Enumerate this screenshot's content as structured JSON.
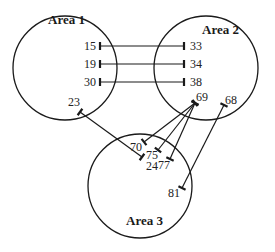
{
  "areas": [
    {
      "id": "area1",
      "label": "Area 1",
      "cx": 65,
      "cy": 68,
      "r": 52,
      "lx": 48,
      "ly": 24
    },
    {
      "id": "area2",
      "label": "Area 2",
      "cx": 206,
      "cy": 68,
      "r": 52,
      "lx": 202,
      "ly": 34
    },
    {
      "id": "area3",
      "label": "Area 3",
      "cx": 140,
      "cy": 186,
      "r": 52,
      "lx": 126,
      "ly": 225
    }
  ],
  "nodes": {
    "n15": {
      "label": "15",
      "area": "Area 1",
      "x": 100,
      "y": 46,
      "lx": 84,
      "ly": 50
    },
    "n19": {
      "label": "19",
      "area": "Area 1",
      "x": 100,
      "y": 64,
      "lx": 84,
      "ly": 68
    },
    "n30": {
      "label": "30",
      "area": "Area 1",
      "x": 100,
      "y": 82,
      "lx": 84,
      "ly": 86
    },
    "n23": {
      "label": "23",
      "area": "Area 1",
      "x": 80,
      "y": 112,
      "lx": 68,
      "ly": 106
    },
    "n33": {
      "label": "33",
      "area": "Area 2",
      "x": 184,
      "y": 46,
      "lx": 190,
      "ly": 50
    },
    "n34": {
      "label": "34",
      "area": "Area 2",
      "x": 184,
      "y": 64,
      "lx": 190,
      "ly": 68
    },
    "n38": {
      "label": "38",
      "area": "Area 2",
      "x": 184,
      "y": 82,
      "lx": 190,
      "ly": 86
    },
    "n69": {
      "label": "69",
      "area": "Area 2",
      "x": 195,
      "y": 103,
      "lx": 196,
      "ly": 101
    },
    "n68": {
      "label": "68",
      "area": "Area 2",
      "x": 224,
      "y": 105,
      "lx": 225,
      "ly": 104
    },
    "n24": {
      "label": "24",
      "area": "Area 3",
      "x": 142,
      "y": 157,
      "lx": 146,
      "ly": 170
    },
    "n70": {
      "label": "70",
      "area": "Area 3",
      "x": 144,
      "y": 142,
      "lx": 130,
      "ly": 151
    },
    "n75": {
      "label": "75",
      "area": "Area 3",
      "x": 158,
      "y": 150,
      "lx": 146,
      "ly": 159
    },
    "n77": {
      "label": "77",
      "area": "Area 3",
      "x": 170,
      "y": 159,
      "lx": 158,
      "ly": 169
    },
    "n81": {
      "label": "81",
      "area": "Area 3",
      "x": 182,
      "y": 188,
      "lx": 168,
      "ly": 197
    }
  },
  "connections": [
    {
      "from": "n15",
      "to": "n33"
    },
    {
      "from": "n19",
      "to": "n34"
    },
    {
      "from": "n30",
      "to": "n38"
    },
    {
      "from": "n23",
      "to": "n24"
    },
    {
      "from": "n69",
      "to": "n70"
    },
    {
      "from": "n69",
      "to": "n75"
    },
    {
      "from": "n69",
      "to": "n77"
    },
    {
      "from": "n68",
      "to": "n81"
    }
  ]
}
